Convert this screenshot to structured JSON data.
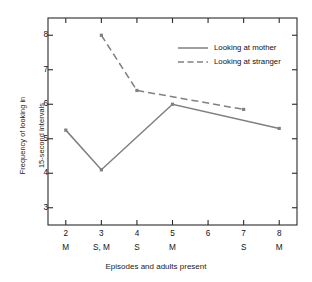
{
  "chart_data": {
    "type": "line",
    "title": "",
    "xlabel": "Episodes and adults present",
    "ylabel_line1": "Frequency of looking in",
    "ylabel_line2": "15-second intervals",
    "x": [
      2,
      3,
      4,
      5,
      6,
      7,
      8
    ],
    "xtick_labels": [
      "2",
      "3",
      "4",
      "5",
      "6",
      "7",
      "8"
    ],
    "xtick_adults": [
      "M",
      "S, M",
      "S",
      "M",
      "",
      "S",
      "M"
    ],
    "ytick_labels": [
      "3",
      "4",
      "5",
      "6",
      "7",
      "8"
    ],
    "ytick_values": [
      3,
      4,
      5,
      6,
      7,
      8
    ],
    "ylim": [
      2.5,
      8.5
    ],
    "xlim": [
      1.5,
      8.5
    ],
    "grid": false,
    "legend_position": "upper right",
    "series": [
      {
        "name": "Looking at mother",
        "style": "solid",
        "color": "#808080",
        "x": [
          2,
          3,
          5,
          8
        ],
        "values": [
          5.25,
          4.1,
          6.0,
          5.3
        ]
      },
      {
        "name": "Looking at stranger",
        "style": "dashed",
        "color": "#808080",
        "x": [
          3,
          4,
          7
        ],
        "values": [
          8.0,
          6.4,
          5.85
        ]
      }
    ]
  },
  "legend": {
    "items": [
      {
        "label": "Looking at mother",
        "style": "solid"
      },
      {
        "label": "Looking at stranger",
        "style": "dashed"
      }
    ]
  },
  "colors": {
    "line": "#808080",
    "axis": "#2b2b2b",
    "text": "#1a1a1a",
    "background": "#ffffff"
  }
}
